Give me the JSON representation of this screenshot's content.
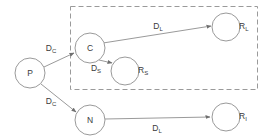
{
  "diagram": {
    "title": "",
    "colors": {
      "stroke": "#9a9a9a",
      "text": "#3a3a3a",
      "node_fill": "#ffffff",
      "background": "#ffffff",
      "group_border": "#9a9a9a"
    },
    "nodes": [
      {
        "id": "P",
        "label": "P",
        "sub": "",
        "cx": 30,
        "cy": 73,
        "r": 15,
        "label_position": "inside"
      },
      {
        "id": "C",
        "label": "C",
        "sub": "",
        "cx": 90,
        "cy": 48,
        "r": 15,
        "label_position": "inside"
      },
      {
        "id": "RS",
        "label": "R",
        "sub": "S",
        "cx": 125,
        "cy": 71,
        "r": 14,
        "label_position": "outside-right"
      },
      {
        "id": "RL",
        "label": "R",
        "sub": "L",
        "cx": 226,
        "cy": 27,
        "r": 14,
        "label_position": "outside-right"
      },
      {
        "id": "N",
        "label": "N",
        "sub": "",
        "cx": 90,
        "cy": 120,
        "r": 15,
        "label_position": "inside"
      },
      {
        "id": "RI",
        "label": "R",
        "sub": "I",
        "cx": 226,
        "cy": 117,
        "r": 14,
        "label_position": "outside-right"
      }
    ],
    "edges": [
      {
        "id": "P-C",
        "from": "P",
        "to": "C",
        "label": "D",
        "sub": "C",
        "x1": 44,
        "y1": 67,
        "x2": 74,
        "y2": 53,
        "lx": 51,
        "ly": 48
      },
      {
        "id": "P-N",
        "from": "P",
        "to": "N",
        "label": "D",
        "sub": "C",
        "x1": 41,
        "y1": 84,
        "x2": 76,
        "y2": 112,
        "lx": 51,
        "ly": 101
      },
      {
        "id": "C-RL",
        "from": "C",
        "to": "RL",
        "label": "D",
        "sub": "L",
        "x1": 103,
        "y1": 43,
        "x2": 211,
        "y2": 26,
        "lx": 158,
        "ly": 26
      },
      {
        "id": "C-RS",
        "from": "C",
        "to": "RS",
        "label": "D",
        "sub": "S",
        "x1": 99,
        "y1": 60,
        "x2": 112,
        "y2": 63,
        "lx": 96,
        "ly": 68
      },
      {
        "id": "N-RI",
        "from": "N",
        "to": "RI",
        "label": "D",
        "sub": "L",
        "x1": 105,
        "y1": 119,
        "x2": 210,
        "y2": 117,
        "lx": 157,
        "ly": 128
      }
    ],
    "group_boxes": [
      {
        "id": "dashed-group",
        "x": 70,
        "y": 6,
        "width": 187,
        "height": 83
      }
    ]
  }
}
